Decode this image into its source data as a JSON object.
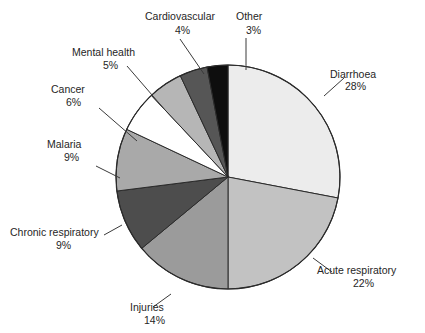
{
  "chart_data": {
    "type": "pie",
    "title": "",
    "subtitle": "",
    "xlabel": "",
    "ylabel": "",
    "legend_position": "none",
    "grid": false,
    "units": "%",
    "start_angle_deg": 0,
    "direction": "clockwise",
    "total": 100,
    "categories": [
      "Diarrhoea",
      "Acute respiratory",
      "Injuries",
      "Chronic respiratory",
      "Malaria",
      "Cancer",
      "Mental health",
      "Cardiovascular",
      "Other"
    ],
    "values": [
      28,
      22,
      14,
      9,
      9,
      6,
      5,
      4,
      3
    ],
    "slices": [
      {
        "label": "Diarrhoea",
        "value": 28,
        "value_text": "28%",
        "color": "#ececec",
        "label_x": 330,
        "label_y": 78,
        "value_x": 345,
        "value_y": 90,
        "leader": "M 324 96 L 344 78"
      },
      {
        "label": "Acute respiratory",
        "value": 22,
        "value_text": "22%",
        "color": "#c2c2c2",
        "label_x": 317,
        "label_y": 274,
        "value_x": 353,
        "value_y": 287,
        "leader": "M 313 258 L 332 272"
      },
      {
        "label": "Injuries",
        "value": 14,
        "value_text": "14%",
        "color": "#9b9b9b",
        "label_x": 130,
        "label_y": 311,
        "value_x": 144,
        "value_y": 324,
        "leader": "M 171 294 L 153 307"
      },
      {
        "label": "Chronic respiratory",
        "value": 9,
        "value_text": "9%",
        "color": "#4d4d4d",
        "label_x": 10,
        "label_y": 236,
        "value_x": 56,
        "value_y": 249,
        "leader": "M 122 225 L 104 235"
      },
      {
        "label": "Malaria",
        "value": 9,
        "value_text": "9%",
        "color": "#a9a9a9",
        "label_x": 47,
        "label_y": 148,
        "value_x": 64,
        "value_y": 161,
        "leader": "M 120 178 L 96 166"
      },
      {
        "label": "Cancer",
        "value": 6,
        "value_text": "6%",
        "color": "#ffffff",
        "label_x": 51,
        "label_y": 93,
        "value_x": 66,
        "value_y": 106,
        "leader": "M 137 141 L 99 108"
      },
      {
        "label": "Mental health",
        "value": 5,
        "value_text": "5%",
        "color": "#b6b6b6",
        "label_x": 72,
        "label_y": 56,
        "value_x": 103,
        "value_y": 69,
        "leader": "M 165 110 L 127 66"
      },
      {
        "label": "Cardiovascular",
        "value": 4,
        "value_text": "4%",
        "color": "#565656",
        "label_x": 145,
        "label_y": 20,
        "value_x": 175,
        "value_y": 34,
        "leader": "M 204 74 L 180 39"
      },
      {
        "label": "Other",
        "value": 3,
        "value_text": "3%",
        "color": "#0e0e0e",
        "label_x": 236,
        "label_y": 20,
        "value_x": 246,
        "value_y": 34,
        "leader": "M 246 70 L 246 38"
      }
    ],
    "geometry": {
      "cx": 228,
      "cy": 177,
      "r": 112
    },
    "colors": {
      "outline": "#2b2b2b",
      "text": "#262626",
      "background": "#ffffff"
    }
  }
}
